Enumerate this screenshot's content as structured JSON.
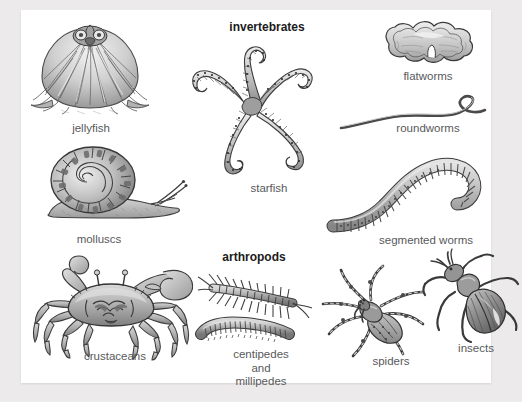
{
  "panel": {
    "background_color": "#ffffff",
    "page_background_color": "#eceaea"
  },
  "headings": [
    {
      "id": "invertebrates",
      "label": "invertebrates"
    },
    {
      "id": "arthropods",
      "label": "arthropods"
    }
  ],
  "groups": {
    "invertebrates": {
      "label": "invertebrates",
      "members": [
        {
          "id": "jellyfish",
          "label": "jellyfish"
        },
        {
          "id": "starfish",
          "label": "starfish"
        },
        {
          "id": "flatworms",
          "label": "flatworms"
        },
        {
          "id": "roundworms",
          "label": "roundworms"
        },
        {
          "id": "molluscs",
          "label": "molluscs"
        },
        {
          "id": "segmented-worms",
          "label": "segmented worms"
        }
      ]
    },
    "arthropods": {
      "label": "arthropods",
      "members": [
        {
          "id": "crustaceans",
          "label": "crustaceans"
        },
        {
          "id": "centipedes-millipedes",
          "label": "centipedes\nand\nmillipedes"
        },
        {
          "id": "spiders",
          "label": "spiders"
        },
        {
          "id": "insects",
          "label": "insects"
        }
      ]
    }
  },
  "caption_color": "#58595b",
  "heading_color": "#1b1b1b",
  "illustration_palette": {
    "ink": "#3b3b3b",
    "mid_gray": "#8e8e8e",
    "light_gray": "#c9c9c9",
    "pale": "#e3e3e3"
  }
}
